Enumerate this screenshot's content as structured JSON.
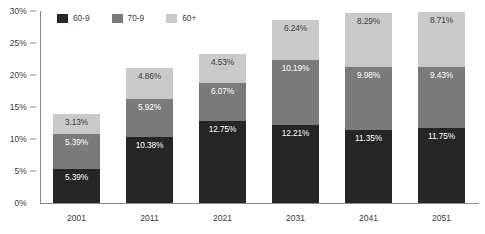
{
  "chart_data": {
    "type": "bar",
    "stacked": true,
    "title": "",
    "subtitle": "",
    "xlabel": "",
    "ylabel": "",
    "categories": [
      "2001",
      "2011",
      "2021",
      "2031",
      "2041",
      "2051"
    ],
    "series": [
      {
        "name": "60-9",
        "color": "#262626",
        "values": [
          5.39,
          10.38,
          12.75,
          12.21,
          11.35,
          11.75
        ],
        "labels": [
          "5.39%",
          "10.38%",
          "12.75%",
          "12.21%",
          "11.35%",
          "11.75%"
        ]
      },
      {
        "name": "70-9",
        "color": "#7a7a7a",
        "values": [
          5.39,
          5.92,
          6.07,
          10.19,
          9.98,
          9.43
        ],
        "labels": [
          "5.39%",
          "5.92%",
          "6.07%",
          "10.19%",
          "9.98%",
          "9.43%"
        ]
      },
      {
        "name": "60+",
        "color": "#c9c9c9",
        "values": [
          3.13,
          4.86,
          4.53,
          6.24,
          8.29,
          8.71
        ],
        "labels": [
          "3.13%",
          "4.86%",
          "4.53%",
          "6.24%",
          "8.29%",
          "8.71%"
        ]
      }
    ],
    "totals": [
      13.91,
      21.16,
      23.35,
      28.64,
      29.62,
      29.89
    ],
    "ylim": [
      0,
      30
    ],
    "y_ticks": [
      0,
      5,
      10,
      15,
      20,
      25,
      30
    ],
    "y_tick_labels": [
      "0%",
      "5%",
      "10%",
      "15%",
      "20%",
      "25%",
      "30%"
    ],
    "grid": false,
    "legend_position": "top-left",
    "legend_entries": [
      "60-9",
      "70-9",
      "60+"
    ]
  },
  "axis": {
    "axis_color": "#8a8a8a",
    "label_color": "#3a3a3a"
  }
}
